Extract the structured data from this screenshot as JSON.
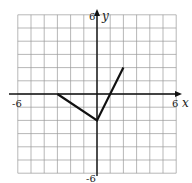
{
  "chart_data": {
    "type": "line",
    "title": "",
    "xlabel": "x",
    "ylabel": "y",
    "xlim": [
      -6,
      6
    ],
    "ylim": [
      -6,
      6
    ],
    "grid": true,
    "grid_step": 1,
    "tick_labels": {
      "x_min": "-6",
      "x_max": "6",
      "y_min": "-6",
      "y_max": "6"
    },
    "series": [
      {
        "name": "piecewise-linear",
        "points": [
          [
            -3,
            0
          ],
          [
            0,
            -2
          ],
          [
            2,
            2
          ]
        ]
      }
    ]
  },
  "labels": {
    "x_axis": "x",
    "y_axis": "y",
    "x_min": "-6",
    "x_max": "6",
    "y_min": "-6",
    "y_max": "6"
  }
}
